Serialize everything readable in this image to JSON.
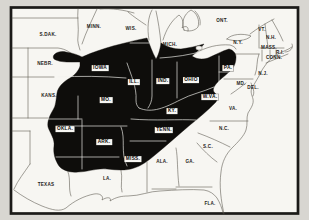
{
  "figure": {
    "type": "map",
    "colors": {
      "region": "#0e0d0b",
      "paper": "#f7f6f2",
      "margin": "#d8d6d1",
      "line": "#57534b",
      "innerline": "#f2f1ed",
      "frame": "#1b1a18"
    }
  },
  "map": {
    "labels": [
      {
        "text": "S.DAK.",
        "x": 48,
        "y": 34,
        "boxed": false
      },
      {
        "text": "NEBR.",
        "x": 45,
        "y": 63,
        "boxed": false
      },
      {
        "text": "KANS.",
        "x": 49,
        "y": 95,
        "boxed": false
      },
      {
        "text": "TEXAS",
        "x": 46,
        "y": 184,
        "boxed": false
      },
      {
        "text": "LA.",
        "x": 107,
        "y": 178,
        "boxed": false
      },
      {
        "text": "MINN.",
        "x": 94,
        "y": 26,
        "boxed": false
      },
      {
        "text": "WIS.",
        "x": 131,
        "y": 28,
        "boxed": false
      },
      {
        "text": "MICH.",
        "x": 170,
        "y": 44,
        "boxed": false
      },
      {
        "text": "ONT.",
        "x": 222,
        "y": 20,
        "boxed": false
      },
      {
        "text": "N.Y.",
        "x": 238,
        "y": 42,
        "boxed": false
      },
      {
        "text": "VT.",
        "x": 262,
        "y": 29,
        "boxed": false
      },
      {
        "text": "N.H.",
        "x": 271,
        "y": 37,
        "boxed": false
      },
      {
        "text": "MASS.",
        "x": 269,
        "y": 47,
        "boxed": false
      },
      {
        "text": "R.I.",
        "x": 280,
        "y": 52,
        "boxed": false
      },
      {
        "text": "CONN.",
        "x": 274,
        "y": 57,
        "boxed": false
      },
      {
        "text": "N.J.",
        "x": 263,
        "y": 73,
        "boxed": false
      },
      {
        "text": "MD.",
        "x": 241,
        "y": 83,
        "boxed": false
      },
      {
        "text": "DEL.",
        "x": 253,
        "y": 87,
        "boxed": false
      },
      {
        "text": "VA.",
        "x": 233,
        "y": 108,
        "boxed": false
      },
      {
        "text": "N.C.",
        "x": 224,
        "y": 128,
        "boxed": false
      },
      {
        "text": "S.C.",
        "x": 208,
        "y": 146,
        "boxed": false
      },
      {
        "text": "GA.",
        "x": 190,
        "y": 161,
        "boxed": false
      },
      {
        "text": "ALA.",
        "x": 162,
        "y": 161,
        "boxed": false
      },
      {
        "text": "FLA.",
        "x": 210,
        "y": 203,
        "boxed": false
      },
      {
        "text": "IOWA",
        "x": 100,
        "y": 68,
        "boxed": true
      },
      {
        "text": "ILL.",
        "x": 134,
        "y": 82,
        "boxed": true
      },
      {
        "text": "IND.",
        "x": 163,
        "y": 81,
        "boxed": true
      },
      {
        "text": "OHIO",
        "x": 191,
        "y": 80,
        "boxed": true
      },
      {
        "text": "PA.",
        "x": 228,
        "y": 68,
        "boxed": true
      },
      {
        "text": "W.VA.",
        "x": 210,
        "y": 97,
        "boxed": true
      },
      {
        "text": "MO.",
        "x": 106,
        "y": 100,
        "boxed": true
      },
      {
        "text": "KY.",
        "x": 172,
        "y": 111,
        "boxed": true
      },
      {
        "text": "OKLA.",
        "x": 65,
        "y": 129,
        "boxed": true
      },
      {
        "text": "ARK.",
        "x": 104,
        "y": 142,
        "boxed": true
      },
      {
        "text": "TENN.",
        "x": 164,
        "y": 130,
        "boxed": true
      },
      {
        "text": "MISS.",
        "x": 133,
        "y": 159,
        "boxed": true
      }
    ]
  }
}
